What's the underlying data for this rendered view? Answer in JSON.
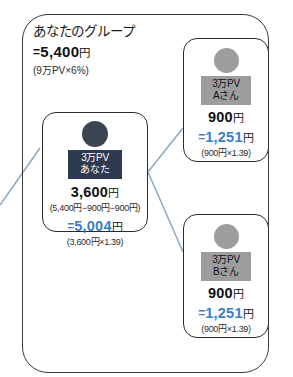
{
  "diagram": {
    "type": "network-compensation-tree",
    "accent_blue": "#3a7fc4",
    "you_badge_color": "#2e3a52",
    "member_badge_color": "#9d9d9d",
    "frame_color": "#3a3a3a"
  },
  "group_header": {
    "title": "あなたのグループ",
    "eq": "=",
    "amount": "5,400",
    "yen": "円",
    "note": "(9万PV×6%)"
  },
  "nodes": {
    "you": {
      "badge_pv": "3万PV",
      "badge_name": "あなた",
      "amount": "3,600",
      "yen": "円",
      "breakdown": "(5,400円−900円−900円)",
      "eq": "=",
      "converted": "5,004",
      "converted_yen": "円",
      "converted_note": "(3,600円×1.39)"
    },
    "a": {
      "badge_pv": "3万PV",
      "badge_name": "Aさん",
      "amount": "900",
      "yen": "円",
      "eq": "=",
      "converted": "1,251",
      "converted_yen": "円",
      "converted_note": "(900円×1.39)"
    },
    "b": {
      "badge_pv": "3万PV",
      "badge_name": "Bさん",
      "amount": "900",
      "yen": "円",
      "eq": "=",
      "converted": "1,251",
      "converted_yen": "円",
      "converted_note": "(900円×1.39)"
    }
  }
}
